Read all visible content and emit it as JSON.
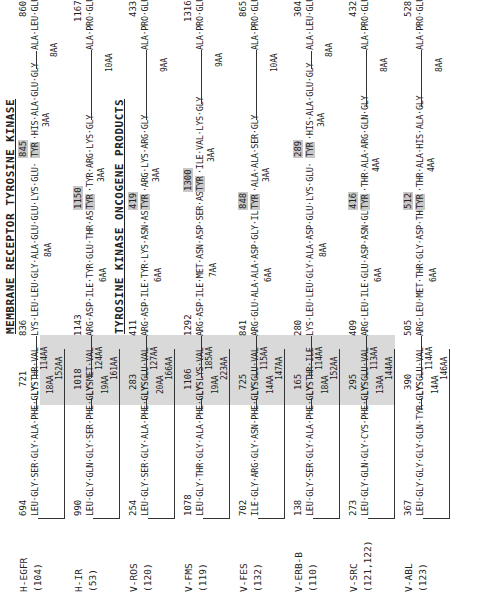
{
  "headings": {
    "membrane": "MEMBRANE RECEPTOR TYROSINE KINASE",
    "oncogene": "TYROSINE KINASE ONCOGENE PRODUCTS"
  },
  "rows": [
    {
      "name": "H-EGFR",
      "ref": "(104)",
      "start": "694",
      "start_seq": "LEU·GLY·SER·GLY·ALA·PHE·GLY·THR·VAL",
      "lys_pos": "721",
      "lys": "LYS",
      "aa_a": "18AA",
      "aa_b": "114AA",
      "aa_c": "152AA",
      "mid_pos": "836",
      "mid_seq": "LYS·LEU·LEU·GLY·ALA·GLU·GLU·LYS·GLU·",
      "tyr_pos": "845",
      "tyr": "TYR",
      "after_tyr": "·HIS·ALA·GLU·GLY",
      "aa_d": "8AA",
      "aa_e": "3AA",
      "aa_f": "8AA",
      "end_pos": "860",
      "end_seq": "ALA·LEU·GLU"
    },
    {
      "name": "H-IR",
      "ref": "(53)",
      "start": "990",
      "start_seq": "LEU·GLY·GLN·GLY·SER·PHE·GLY·MET·VAL",
      "lys_pos": "1018",
      "lys": "LYS",
      "aa_a": "19AA",
      "aa_b": "124AA",
      "aa_c": "161AA",
      "mid_pos": "1143",
      "mid_seq": "ARG·ASP·ILE·TYR·GLU·THR·ASP·",
      "tyr_pos": "1150",
      "tyr": "TYR",
      "after_tyr": "·TYR·ARG·LYS·GLY",
      "aa_d": "6AA",
      "aa_e": "3AA",
      "aa_f": "10AA",
      "end_pos": "1167",
      "end_seq": "ALA·PRO·GLU"
    },
    {
      "name": "V-ROS",
      "ref": "(120)",
      "start": "254",
      "start_seq": "LEU·GLY·SER·GLY·ALA·PHE·GLY·GLU·VAL",
      "lys_pos": "283",
      "lys": "LYS",
      "aa_a": "20AA",
      "aa_b": "127AA",
      "aa_c": "166AA",
      "mid_pos": "411",
      "mid_seq": "ARG·ASP·ILE·TYR·LYS·ASN·ASP·",
      "tyr_pos": "419",
      "tyr": "TYR",
      "after_tyr": "·ARG·LYS·ARG·GLY",
      "aa_d": "6AA",
      "aa_e": "3AA",
      "aa_f": "9AA",
      "end_pos": "433",
      "end_seq": "ALA·PRO·GLU"
    },
    {
      "name": "V-FMS",
      "ref": "(119)",
      "start": "1078",
      "start_seq": "LEU·GLY·THR·GLY·ALA·PHE·GLY·LYS·VAL",
      "lys_pos": "1106",
      "lys": "LYS",
      "aa_a": "19AA",
      "aa_b": "185AA",
      "aa_c": "223AA",
      "mid_pos": "1292",
      "mid_seq": "ARG·ASP·ILE·MET·ASN·ASP·SER·ASN·",
      "tyr_pos": "1300",
      "tyr": "TYR",
      "after_tyr": "·ILE·VAL·LYS·GLY",
      "aa_d": "7AA",
      "aa_e": "3AA",
      "aa_f": "9AA",
      "end_pos": "1316",
      "end_seq": "ALA·PRO·GLU"
    },
    {
      "name": "V-FES",
      "ref": "(132)",
      "start": "702",
      "start_seq": "ILE·GLY·ARG·GLY·ASN·PHE·GLY·GLU·VAL",
      "lys_pos": "725",
      "lys": "LYS",
      "aa_a": "14AA",
      "aa_b": "115AA",
      "aa_c": "147AA",
      "mid_pos": "841",
      "mid_seq": "ARG·GLU·ALA·ALA·ASP·GLY·ILE·",
      "tyr_pos": "848",
      "tyr": "TYR",
      "after_tyr": "·ALA·ALA·SER·GLY",
      "aa_d": "6AA",
      "aa_e": "3AA",
      "aa_f": "10AA",
      "end_pos": "865",
      "end_seq": "ALA·PRO·GLU"
    },
    {
      "name": "V-ERB-B",
      "ref": "(110)",
      "start": "138",
      "start_seq": "LEU·GLY·SER·GLY·ALA·PHE·GLY·THR·ILE",
      "lys_pos": "165",
      "lys": "LYS",
      "aa_a": "18AA",
      "aa_b": "114AA",
      "aa_c": "152AA",
      "mid_pos": "280",
      "mid_seq": "LYS·LEU·LEU·GLY·ALA·ASP·GLU·LYS·GLU·",
      "tyr_pos": "289",
      "tyr": "TYR",
      "after_tyr": "·HIS·ALA·GLU·GLY",
      "aa_d": "8AA",
      "aa_e": "3AA",
      "aa_f": "8AA",
      "end_pos": "304",
      "end_seq": "ALA·LEU·GLU"
    },
    {
      "name": "V-SRC",
      "ref": "(121,122)",
      "start": "273",
      "start_seq": "LEU·GLY·GLN·GLY·CYS·PHE·GLY·GLU·VAL",
      "lys_pos": "295",
      "lys": "LYS",
      "aa_a": "13AA",
      "aa_b": "113AA",
      "aa_c": "144AA",
      "mid_pos": "409",
      "mid_seq": "ARG·LEU·ILE·GLU·ASP·ASN·GLU·",
      "tyr_pos": "416",
      "tyr": "TYR",
      "after_tyr": "·THR·ALA·ARG·GLN·GLY",
      "aa_d": "6AA",
      "aa_e": "4AA",
      "aa_f": "8AA",
      "end_pos": "432",
      "end_seq": "ALA·PRO·GLU"
    },
    {
      "name": "V-ABL",
      "ref": "(123)",
      "start": "367",
      "start_seq": "LEU·GLY·GLY·GLY·GLN·TYR·GLY·GLU·VAL",
      "lys_pos": "390",
      "lys": "LYS",
      "aa_a": "14AA",
      "aa_b": "114AA",
      "aa_c": "146AA",
      "mid_pos": "505",
      "mid_seq": "ARG·LEU·MET·THR·GLY·ASP·THR·",
      "tyr_pos": "512",
      "tyr": "TYR",
      "after_tyr": "·THR·ALA·HIS·ALA·GLY",
      "aa_d": "6AA",
      "aa_e": "4AA",
      "aa_f": "8AA",
      "end_pos": "528",
      "end_seq": "ALA·PRO·GLU"
    }
  ]
}
